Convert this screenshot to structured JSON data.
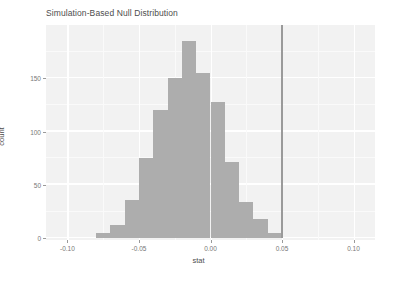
{
  "chart_data": {
    "type": "bar",
    "title": "Simulation-Based Null Distribution",
    "xlabel": "stat",
    "ylabel": "count",
    "xlim": [
      -0.115,
      0.115
    ],
    "ylim": [
      0,
      200
    ],
    "grid": true,
    "legend": null,
    "bin_width": 0.01,
    "categories": [
      "-0.080",
      "-0.070",
      "-0.060",
      "-0.050",
      "-0.040",
      "-0.030",
      "-0.020",
      "-0.010",
      "0.000",
      "0.010",
      "0.020",
      "0.030",
      "0.040"
    ],
    "bin_starts": [
      -0.08,
      -0.07,
      -0.06,
      -0.05,
      -0.04,
      -0.03,
      -0.02,
      -0.01,
      0.0,
      0.01,
      0.02,
      0.03,
      0.04
    ],
    "values": [
      5,
      12,
      36,
      75,
      120,
      150,
      185,
      155,
      128,
      71,
      34,
      18,
      5
    ],
    "xticks": [
      "-0.10",
      "-0.05",
      "0.00",
      "0.05",
      "0.10"
    ],
    "xtick_values": [
      -0.1,
      -0.05,
      0.0,
      0.05,
      0.1
    ],
    "yticks": [
      "0",
      "50",
      "100",
      "150"
    ],
    "ytick_values": [
      0,
      50,
      100,
      150
    ],
    "annotations": [
      {
        "name": "observed-stat-line",
        "type": "vline",
        "value": 0.05,
        "color": "#9a9a9a"
      }
    ],
    "colors": {
      "bar_fill": "#adadad",
      "panel_background": "#f2f2f2",
      "gridline": "#ffffff",
      "axis_text": "#777777",
      "title_text": "#4d4d4d",
      "vline": "#9a9a9a"
    }
  }
}
